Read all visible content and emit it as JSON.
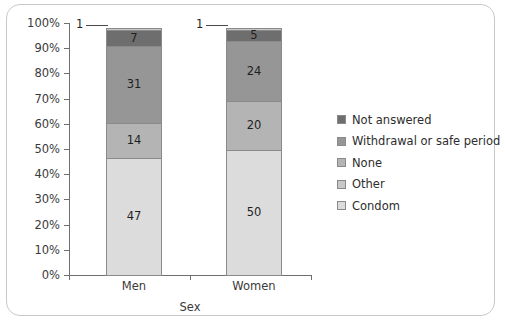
{
  "chart_data": {
    "type": "bar",
    "subtype": "stacked-100-percent",
    "title": "",
    "xlabel": "Sex",
    "ylabel": "",
    "categories": [
      "Men",
      "Women"
    ],
    "ylim": [
      0,
      100
    ],
    "ytick_labels": [
      "0%",
      "10%",
      "20%",
      "30%",
      "40%",
      "50%",
      "60%",
      "70%",
      "80%",
      "90%",
      "100%"
    ],
    "ytick_values": [
      0,
      10,
      20,
      30,
      40,
      50,
      60,
      70,
      80,
      90,
      100
    ],
    "grid": false,
    "legend_position": "right",
    "series": [
      {
        "name": "Condom",
        "color": "#dcdcdc",
        "values": [
          47,
          50
        ]
      },
      {
        "name": "Other",
        "color": "#c8c8c8",
        "values": [
          1,
          1
        ]
      },
      {
        "name": "None",
        "color": "#b4b4b4",
        "values": [
          14,
          20
        ]
      },
      {
        "name": "Withdrawal or safe period",
        "color": "#969696",
        "values": [
          31,
          24
        ]
      },
      {
        "name": "Not answered",
        "color": "#6e6e6e",
        "values": [
          7,
          5
        ]
      }
    ],
    "stack_order_bottom_to_top": [
      "Condom",
      "None",
      "Withdrawal or safe period",
      "Not answered",
      "Other"
    ],
    "bars": [
      {
        "category": "Men",
        "segments": [
          {
            "name": "Condom",
            "value": 47,
            "label": "47",
            "color": "#dcdcdc",
            "label_shown": true
          },
          {
            "name": "None",
            "value": 14,
            "label": "14",
            "color": "#b4b4b4",
            "label_shown": true
          },
          {
            "name": "Withdrawal or safe period",
            "value": 31,
            "label": "31",
            "color": "#969696",
            "label_shown": true
          },
          {
            "name": "Not answered",
            "value": 7,
            "label": "7",
            "color": "#6e6e6e",
            "label_shown": true
          },
          {
            "name": "Other",
            "value": 1,
            "label": "1",
            "color": "#c8c8c8",
            "label_shown": false
          }
        ],
        "callout": "1"
      },
      {
        "category": "Women",
        "segments": [
          {
            "name": "Condom",
            "value": 50,
            "label": "50",
            "color": "#dcdcdc",
            "label_shown": true
          },
          {
            "name": "None",
            "value": 20,
            "label": "20",
            "color": "#b4b4b4",
            "label_shown": true
          },
          {
            "name": "Withdrawal or safe period",
            "value": 24,
            "label": "24",
            "color": "#969696",
            "label_shown": true
          },
          {
            "name": "Not answered",
            "value": 5,
            "label": "5",
            "color": "#6e6e6e",
            "label_shown": true
          },
          {
            "name": "Other",
            "value": 1,
            "label": "1",
            "color": "#c8c8c8",
            "label_shown": false
          }
        ],
        "callout": "1"
      }
    ],
    "legend": [
      {
        "label": "Not answered",
        "color": "#6e6e6e"
      },
      {
        "label": "Withdrawal or safe period",
        "color": "#969696"
      },
      {
        "label": "None",
        "color": "#b4b4b4"
      },
      {
        "label": "Other",
        "color": "#c8c8c8"
      },
      {
        "label": "Condom",
        "color": "#dcdcdc"
      }
    ]
  }
}
